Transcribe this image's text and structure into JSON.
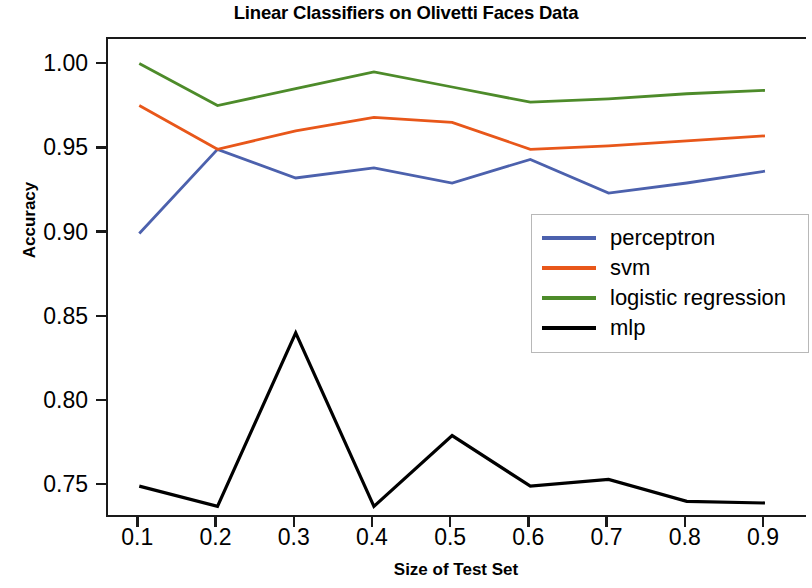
{
  "chart_data": {
    "type": "line",
    "title": "Linear Classifiers on Olivetti Faces Data",
    "xlabel": "Size of Test Set",
    "ylabel": "Accuracy",
    "x": [
      0.1,
      0.2,
      0.3,
      0.4,
      0.5,
      0.6,
      0.7,
      0.8,
      0.9
    ],
    "xticklabels": [
      "0.1",
      "0.2",
      "0.3",
      "0.4",
      "0.5",
      "0.6",
      "0.7",
      "0.8",
      "0.9"
    ],
    "yticks": [
      0.75,
      0.8,
      0.85,
      0.9,
      0.95,
      1.0
    ],
    "yticklabels": [
      "0.75",
      "0.80",
      "0.85",
      "0.90",
      "0.95",
      "1.00"
    ],
    "xlim": [
      0.06,
      0.955
    ],
    "ylim": [
      0.7305,
      1.0155
    ],
    "grid": false,
    "legend_position": "center right",
    "series": [
      {
        "name": "perceptron",
        "color": "#4c61ad",
        "values": [
          0.9,
          0.95,
          0.933,
          0.939,
          0.93,
          0.944,
          0.924,
          0.93,
          0.937
        ]
      },
      {
        "name": "svm",
        "color": "#e8571a",
        "values": [
          0.976,
          0.95,
          0.961,
          0.969,
          0.966,
          0.95,
          0.952,
          0.955,
          0.958
        ]
      },
      {
        "name": "logistic regression",
        "color": "#4d8b2a",
        "values": [
          1.001,
          0.976,
          0.986,
          0.996,
          0.987,
          0.978,
          0.98,
          0.983,
          0.985
        ]
      },
      {
        "name": "mlp",
        "color": "#000000",
        "values": [
          0.75,
          0.738,
          0.841,
          0.738,
          0.78,
          0.75,
          0.754,
          0.741,
          0.74
        ]
      }
    ]
  }
}
